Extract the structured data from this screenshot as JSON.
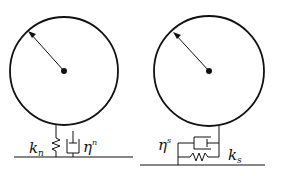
{
  "diagram": {
    "type": "contact-model-schematic",
    "panels": [
      {
        "name": "normal-contact",
        "labels": {
          "spring": "k",
          "spring_sub": "n",
          "damper": "η",
          "damper_sup": "n"
        }
      },
      {
        "name": "tangential-contact",
        "labels": {
          "damper": "η",
          "damper_sup": "s",
          "spring": "k",
          "spring_sub": "s"
        }
      }
    ],
    "colors": {
      "stroke": "#111111",
      "background": "#ffffff"
    }
  }
}
